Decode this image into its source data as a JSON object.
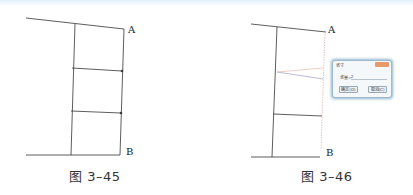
{
  "figures": [
    {
      "id": "fig-3-45",
      "caption": "图 3–45",
      "label_a": "A",
      "label_b": "B"
    },
    {
      "id": "fig-3-46",
      "caption": "图 3–46",
      "label_a": "A",
      "label_b": "B",
      "dialog": {
        "title": "省寸",
        "field_label": "省量=",
        "field_value": "2",
        "ok_label": "确定(O)",
        "cancel_label": "取消(C)"
      }
    }
  ],
  "colors": {
    "line": "#333333",
    "highlight_line": "#e8b8b0",
    "dialog_border": "#8fb5cf",
    "dialog_close": "#e89a6a"
  }
}
